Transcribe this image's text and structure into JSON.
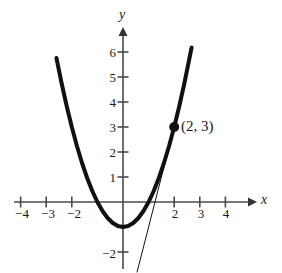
{
  "figure": {
    "width": 282,
    "height": 273,
    "background": "#ffffff",
    "ink_color": "#111111",
    "axis_color": "#4a4a4a"
  },
  "chart_data": {
    "type": "line",
    "title": "",
    "xlabel": "x",
    "ylabel": "y",
    "xlim": [
      -4.6,
      5.0
    ],
    "ylim": [
      -2.9,
      6.9
    ],
    "grid": false,
    "legend": null,
    "x_ticks": [
      -4,
      -3,
      -2,
      2,
      3,
      4
    ],
    "x_tick_labels": [
      "−4",
      "−3",
      "−2",
      "2",
      "3",
      "4"
    ],
    "y_ticks": [
      -2,
      1,
      2,
      3,
      4,
      5,
      6
    ],
    "y_tick_labels": [
      "−2",
      "1",
      "2",
      "3",
      "4",
      "5",
      "6"
    ],
    "series": [
      {
        "name": "parabola",
        "kind": "curve",
        "equation": "y = x^2 - 1",
        "stroke_width": 4,
        "x_start": -2.6,
        "x_end": 2.68,
        "points": [
          {
            "x": -2.6,
            "y": 5.76
          },
          {
            "x": -2.4,
            "y": 4.76
          },
          {
            "x": -2.2,
            "y": 3.84
          },
          {
            "x": -2.0,
            "y": 3.0
          },
          {
            "x": -1.8,
            "y": 2.24
          },
          {
            "x": -1.6,
            "y": 1.56
          },
          {
            "x": -1.4,
            "y": 0.96
          },
          {
            "x": -1.2,
            "y": 0.44
          },
          {
            "x": -1.0,
            "y": 0.0
          },
          {
            "x": -0.8,
            "y": -0.36
          },
          {
            "x": -0.6,
            "y": -0.64
          },
          {
            "x": -0.4,
            "y": -0.84
          },
          {
            "x": -0.2,
            "y": -0.96
          },
          {
            "x": 0.0,
            "y": -1.0
          },
          {
            "x": 0.2,
            "y": -0.96
          },
          {
            "x": 0.4,
            "y": -0.84
          },
          {
            "x": 0.6,
            "y": -0.64
          },
          {
            "x": 0.8,
            "y": -0.36
          },
          {
            "x": 1.0,
            "y": 0.0
          },
          {
            "x": 1.2,
            "y": 0.44
          },
          {
            "x": 1.4,
            "y": 0.96
          },
          {
            "x": 1.6,
            "y": 1.56
          },
          {
            "x": 1.8,
            "y": 2.24
          },
          {
            "x": 2.0,
            "y": 3.0
          },
          {
            "x": 2.2,
            "y": 3.84
          },
          {
            "x": 2.4,
            "y": 4.76
          },
          {
            "x": 2.68,
            "y": 6.18
          }
        ]
      },
      {
        "name": "tangent-line",
        "kind": "line",
        "equation": "y = 4x - 5",
        "stroke_width": 1,
        "points": [
          {
            "x": 0.55,
            "y": -2.8
          },
          {
            "x": 2.05,
            "y": 3.2
          }
        ]
      }
    ],
    "annotations": [
      {
        "name": "point-2-3",
        "label": "(2, 3)",
        "x": 2,
        "y": 3,
        "marker": "filled-circle",
        "marker_radius": 5,
        "label_dx": 9,
        "label_dy": 0
      }
    ]
  },
  "labels": {
    "y_axis_name": "y",
    "x_axis_name": "x",
    "point_label": "(2, 3)",
    "x_minus_4": "−4",
    "x_minus_3": "−3",
    "x_minus_2": "−2",
    "x_2": "2",
    "x_3": "3",
    "x_4": "4",
    "y_6": "6",
    "y_5": "5",
    "y_4": "4",
    "y_3": "3",
    "y_2": "2",
    "y_1": "1",
    "y_minus_2": "−2"
  }
}
